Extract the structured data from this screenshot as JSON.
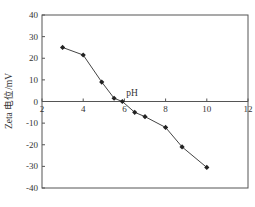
{
  "chart_data": {
    "type": "line",
    "title": "",
    "xlabel": "pH",
    "ylabel": "Zeta 电位/mV",
    "xlim": [
      2,
      12
    ],
    "ylim": [
      -40,
      40
    ],
    "x_ticks": [
      2,
      4,
      6,
      8,
      10,
      12
    ],
    "y_ticks": [
      40,
      30,
      20,
      10,
      0,
      -10,
      -20,
      -30,
      -40
    ],
    "grid": false,
    "legend": null,
    "series": [
      {
        "name": "Zeta potential",
        "marker": "diamond",
        "color": "#333333",
        "x": [
          3.0,
          4.0,
          4.9,
          5.5,
          5.9,
          6.5,
          7.0,
          8.0,
          8.8,
          10.0
        ],
        "y": [
          25,
          21.5,
          9,
          1.5,
          0,
          -5,
          -7,
          -12,
          -21,
          -30.5
        ]
      }
    ]
  },
  "colors": {
    "axis": "#555555",
    "line": "#444444",
    "marker": "#222222",
    "background": "#ffffff"
  }
}
